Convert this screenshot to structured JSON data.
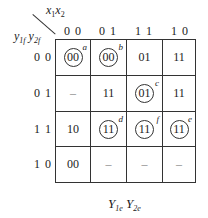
{
  "diagram": {
    "corner": {
      "col_var": "x1x2",
      "row_var": "y1f y2f"
    },
    "col_headers": [
      "0 0",
      "0 1",
      "1 1",
      "1 0"
    ],
    "row_headers": [
      "0 0",
      "0 1",
      "1 1",
      "1 0"
    ],
    "cells": [
      [
        {
          "v": "00",
          "circled": true,
          "tag": "a"
        },
        {
          "v": "00",
          "circled": true,
          "tag": "b"
        },
        {
          "v": "01",
          "circled": false,
          "tag": ""
        },
        {
          "v": "11",
          "circled": false,
          "tag": ""
        }
      ],
      [
        {
          "v": "–",
          "circled": false,
          "tag": ""
        },
        {
          "v": "11",
          "circled": false,
          "tag": ""
        },
        {
          "v": "01",
          "circled": true,
          "tag": "c"
        },
        {
          "v": "11",
          "circled": false,
          "tag": ""
        }
      ],
      [
        {
          "v": "10",
          "circled": false,
          "tag": ""
        },
        {
          "v": "11",
          "circled": true,
          "tag": "d"
        },
        {
          "v": "11",
          "circled": true,
          "tag": "f"
        },
        {
          "v": "11",
          "circled": true,
          "tag": "e"
        }
      ],
      [
        {
          "v": "00",
          "circled": false,
          "tag": ""
        },
        {
          "v": "–",
          "circled": false,
          "tag": ""
        },
        {
          "v": "–",
          "circled": false,
          "tag": ""
        },
        {
          "v": "–",
          "circled": false,
          "tag": ""
        }
      ]
    ],
    "footer_label": "Y1e Y2e"
  }
}
